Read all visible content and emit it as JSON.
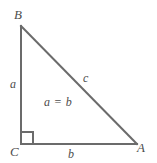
{
  "figure": {
    "type": "right-triangle-geometry-diagram",
    "canvas": {
      "width": 157,
      "height": 163,
      "background": "#ffffff"
    },
    "stroke_color": "#6b6b6b",
    "text_color": "#4d4d4d",
    "vertices": [
      {
        "name": "B",
        "label": "B",
        "x": 21,
        "y": 26
      },
      {
        "name": "C",
        "label": "C",
        "x": 21,
        "y": 144
      },
      {
        "name": "A",
        "label": "A",
        "x": 137,
        "y": 144
      }
    ],
    "sides": [
      {
        "name": "vertical-leg",
        "label": "a",
        "from": "B",
        "to": "C"
      },
      {
        "name": "horizontal-leg",
        "label": "b",
        "from": "C",
        "to": "A"
      },
      {
        "name": "hypotenuse",
        "label": "c",
        "from": "B",
        "to": "A"
      }
    ],
    "right_angle": {
      "at_vertex": "C",
      "marker_size": 12,
      "marker_x": 21,
      "marker_y": 132
    },
    "annotations": [
      {
        "name": "relation",
        "text": "a = b"
      }
    ]
  }
}
